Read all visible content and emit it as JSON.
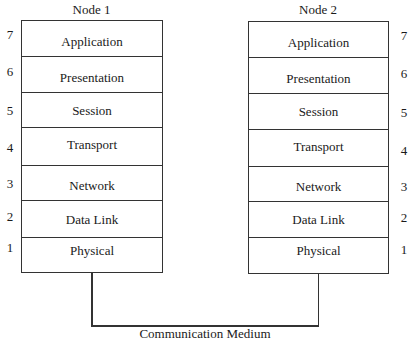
{
  "diagram": {
    "type": "osi-model-two-nodes",
    "nodes": [
      {
        "title": "Node 1",
        "layers": [
          {
            "number": "7",
            "label": "Application"
          },
          {
            "number": "6",
            "label": "Presentation"
          },
          {
            "number": "5",
            "label": "Session"
          },
          {
            "number": "4",
            "label": "Transport"
          },
          {
            "number": "3",
            "label": "Network"
          },
          {
            "number": "2",
            "label": "Data Link"
          },
          {
            "number": "1",
            "label": "Physical"
          }
        ]
      },
      {
        "title": "Node 2",
        "layers": [
          {
            "number": "7",
            "label": "Application"
          },
          {
            "number": "6",
            "label": "Presentation"
          },
          {
            "number": "5",
            "label": "Session"
          },
          {
            "number": "4",
            "label": "Transport"
          },
          {
            "number": "3",
            "label": "Network"
          },
          {
            "number": "2",
            "label": "Data Link"
          },
          {
            "number": "1",
            "label": "Physical"
          }
        ]
      }
    ],
    "medium_label": "Communication Medium",
    "colors": {
      "line": "#333333",
      "background": "#ffffff",
      "text": "#1a1a1a"
    }
  }
}
